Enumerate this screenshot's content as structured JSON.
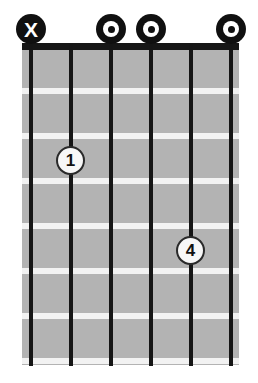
{
  "diagram": {
    "type": "guitar-chord-diagram",
    "title": "",
    "orientation": "vertical",
    "string_count": 6,
    "fret_count": 7,
    "starting_fret": 1,
    "colors": {
      "fretboard": "#b3b3b3",
      "string": "#151515",
      "nut": "#161616",
      "fret_line": "#f2f2f2",
      "marker_fill": "#101010",
      "marker_glyph": "#ffffff",
      "finger_dot_fill": "#f7f7f7",
      "finger_dot_border": "#2a2a2a",
      "background": "#ffffff"
    },
    "geometry": {
      "board_left": 22,
      "board_top": 50,
      "board_width": 217,
      "board_height": 315,
      "nut_top": 43,
      "nut_height": 7,
      "string_positions": [
        31,
        71,
        111,
        151,
        191,
        231
      ],
      "fret_line_positions": [
        88,
        133,
        178,
        223,
        268,
        313,
        358
      ]
    },
    "strings": [
      {
        "index": 1,
        "name": "string-6",
        "x": 31,
        "top_marker": "X",
        "top_marker_label": "X"
      },
      {
        "index": 2,
        "name": "string-5",
        "x": 71,
        "top_marker": "none",
        "top_marker_label": ""
      },
      {
        "index": 3,
        "name": "string-4",
        "x": 111,
        "top_marker": "O",
        "top_marker_label": "O"
      },
      {
        "index": 4,
        "name": "string-3",
        "x": 151,
        "top_marker": "O",
        "top_marker_label": "O"
      },
      {
        "index": 5,
        "name": "string-2",
        "x": 191,
        "top_marker": "none",
        "top_marker_label": ""
      },
      {
        "index": 6,
        "name": "string-1",
        "x": 231,
        "top_marker": "O",
        "top_marker_label": "O"
      }
    ],
    "top_markers": [
      {
        "symbol": "X",
        "string_index": 1,
        "x": 31,
        "y": 29,
        "meaning": "muted"
      },
      {
        "symbol": "O",
        "string_index": 3,
        "x": 111,
        "y": 29,
        "meaning": "open"
      },
      {
        "symbol": "O",
        "string_index": 4,
        "x": 151,
        "y": 29,
        "meaning": "open"
      },
      {
        "symbol": "O",
        "string_index": 6,
        "x": 231,
        "y": 29,
        "meaning": "open"
      }
    ],
    "finger_positions": [
      {
        "finger": "1",
        "string_index": 2,
        "fret": 2,
        "x": 71,
        "y": 161
      },
      {
        "finger": "4",
        "string_index": 5,
        "fret": 4,
        "x": 191,
        "y": 251
      }
    ],
    "fret_lines": [
      {
        "index": 1,
        "y": 88
      },
      {
        "index": 2,
        "y": 133
      },
      {
        "index": 3,
        "y": 178
      },
      {
        "index": 4,
        "y": 223
      },
      {
        "index": 5,
        "y": 268
      },
      {
        "index": 6,
        "y": 313
      },
      {
        "index": 7,
        "y": 358
      }
    ]
  }
}
